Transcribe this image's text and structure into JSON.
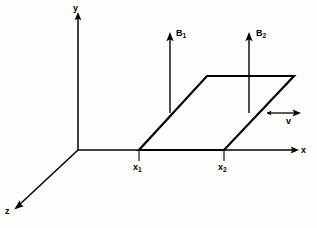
{
  "figure": {
    "background_color": "#fdfdfb",
    "line_color": "#000000",
    "type": "physics-vector-diagram"
  },
  "axes": {
    "y_label": "y",
    "x_label": "x",
    "z_label": "z",
    "origin": {
      "x": 78,
      "y": 150
    },
    "y_tip": {
      "x": 78,
      "y": 14
    },
    "x_tip": {
      "x": 297,
      "y": 150
    },
    "z_tip": {
      "x": 14,
      "y": 209
    }
  },
  "vectors": [
    {
      "name": "B1",
      "label_main": "B",
      "label_sub": "1",
      "tail": {
        "x": 170,
        "y": 113
      },
      "head": {
        "x": 170,
        "y": 33
      },
      "direction": "up"
    },
    {
      "name": "B2",
      "label_main": "B",
      "label_sub": "2",
      "tail": {
        "x": 249,
        "y": 113
      },
      "head": {
        "x": 249,
        "y": 33
      },
      "direction": "up"
    },
    {
      "name": "v",
      "label_main": "v",
      "label_sub": "",
      "tail": {
        "x": 268,
        "y": 113
      },
      "head": {
        "x": 301,
        "y": 113
      },
      "direction": "right"
    }
  ],
  "loop": {
    "name": "conducting-loop",
    "points": [
      {
        "x": 139,
        "y": 150
      },
      {
        "x": 224,
        "y": 150
      },
      {
        "x": 294,
        "y": 76
      },
      {
        "x": 207,
        "y": 76
      }
    ]
  },
  "tick_marks": [
    {
      "name": "x1",
      "label_main": "x",
      "label_sub": "1",
      "x": 139,
      "y_top": 150,
      "y_bottom": 161
    },
    {
      "name": "x2",
      "label_main": "x",
      "label_sub": "2",
      "x": 224,
      "y_top": 150,
      "y_bottom": 161
    }
  ],
  "labels": {
    "y_axis": "y",
    "x_axis": "x",
    "z_axis": "z",
    "b1_main": "B",
    "b1_sub": "1",
    "b2_main": "B",
    "b2_sub": "2",
    "velocity": "v",
    "x1_main": "x",
    "x1_sub": "1",
    "x2_main": "x",
    "x2_sub": "2"
  }
}
